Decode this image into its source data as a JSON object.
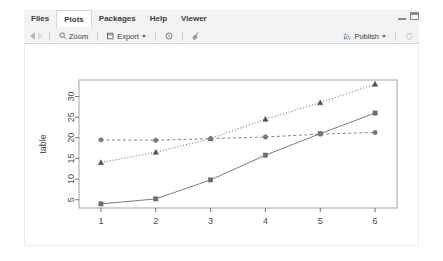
{
  "window": {
    "minimize_icon": "minimize-icon",
    "maximize_icon": "maximize-icon"
  },
  "tabs": [
    {
      "label": "Files",
      "icon": "files-icon",
      "active": false
    },
    {
      "label": "Plots",
      "icon": "plots-icon",
      "active": true
    },
    {
      "label": "Packages",
      "icon": "packages-icon",
      "active": false
    },
    {
      "label": "Help",
      "icon": "help-icon",
      "active": false
    },
    {
      "label": "Viewer",
      "icon": "viewer-icon",
      "active": false
    }
  ],
  "toolbar": {
    "back_icon": "back-arrow-icon",
    "forward_icon": "forward-arrow-icon",
    "zoom_label": "Zoom",
    "zoom_icon": "magnifier-icon",
    "export_label": "Export",
    "export_icon": "export-icon",
    "export_caret": "chevron-down-icon",
    "remove_icon": "remove-plot-icon",
    "clear_icon": "broom-clear-all-icon",
    "publish_label": "Publish",
    "publish_icon": "publish-icon",
    "publish_caret": "chevron-down-icon",
    "refresh_icon": "refresh-icon"
  },
  "chart_data": {
    "type": "line",
    "title": "",
    "xlabel": "",
    "ylabel": "table",
    "x": [
      1,
      2,
      3,
      4,
      5,
      6
    ],
    "xticklabels": [
      "1",
      "2",
      "3",
      "4",
      "5",
      "6"
    ],
    "yticks": [
      5,
      10,
      15,
      20,
      25,
      30
    ],
    "yticklabels": [
      "5",
      "10",
      "15",
      "20",
      "25",
      "30"
    ],
    "xlim": [
      0.6,
      6.4
    ],
    "ylim": [
      3.0,
      34.0
    ],
    "grid": false,
    "legend": "none",
    "series": [
      {
        "name": "series-1",
        "marker": "square",
        "linestyle": "solid",
        "color": "#6e6e6e",
        "values": [
          4,
          5.2,
          9.8,
          15.8,
          21,
          26
        ]
      },
      {
        "name": "series-2",
        "marker": "triangle",
        "linestyle": "dotted",
        "color": "#555555",
        "values": [
          14,
          16.5,
          19.8,
          24.5,
          28.5,
          33
        ]
      },
      {
        "name": "series-3",
        "marker": "circle",
        "linestyle": "dashed",
        "color": "#777777",
        "values": [
          19.5,
          19.4,
          19.8,
          20.2,
          20.9,
          21.3
        ]
      }
    ]
  }
}
